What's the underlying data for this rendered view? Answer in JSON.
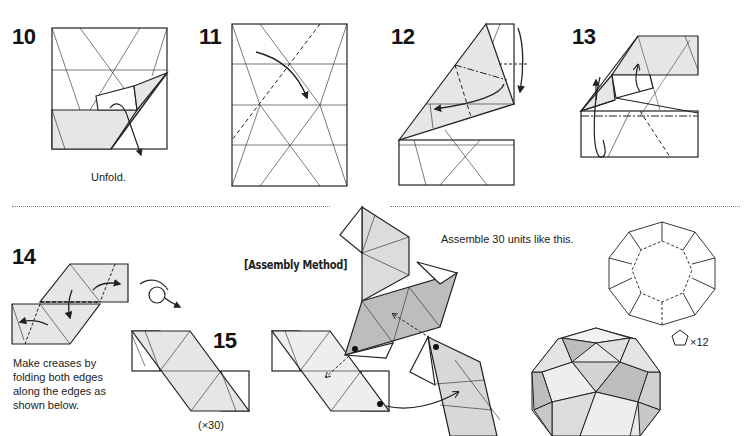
{
  "steps": [
    {
      "number": "10",
      "caption": "Unfold."
    },
    {
      "number": "11",
      "caption": ""
    },
    {
      "number": "12",
      "caption": ""
    },
    {
      "number": "13",
      "caption": ""
    },
    {
      "number": "14",
      "caption": "Make creases by folding both edges along the edges as shown below.",
      "caption_lines": [
        "Make creases by",
        "folding both edges",
        "along the edges as",
        "shown below."
      ]
    },
    {
      "number": "15",
      "caption": "(×30)"
    }
  ],
  "assembly": {
    "heading": "[Assembly Method]",
    "instruction": "Assemble 30 units like this.",
    "pentagon_count": "×12"
  },
  "icons": [
    "fold-arrow-icon",
    "turn-over-icon",
    "pentagon-icon"
  ],
  "colors": {
    "line": "#222222",
    "fill_light": "#e6e6e6",
    "fill_mid": "#cfcfcf",
    "fill_dark": "#b5b5b5",
    "divider": "#888888"
  }
}
